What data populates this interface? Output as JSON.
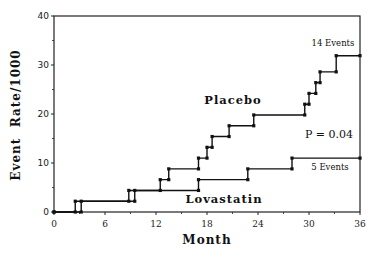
{
  "chart_data": {
    "type": "line",
    "step": true,
    "title": "",
    "xlabel": "Month",
    "ylabel": "Event  Rate/1000",
    "xlim": [
      0,
      36
    ],
    "ylim": [
      0,
      40
    ],
    "xticks": [
      0,
      6,
      12,
      18,
      24,
      30,
      36
    ],
    "yticks": [
      0,
      10,
      20,
      30,
      40
    ],
    "grid": false,
    "legend": "inline labels",
    "series": [
      {
        "name": "Placebo",
        "x": [
          0,
          2.5,
          9.5,
          12.5,
          13.5,
          17,
          18,
          18.6,
          20.6,
          23.5,
          29.5,
          30,
          30.8,
          31.3,
          33.2,
          36
        ],
        "y": [
          0,
          2.2,
          4.4,
          6.6,
          8.8,
          11.0,
          13.2,
          15.4,
          17.6,
          19.8,
          22.0,
          24.2,
          26.4,
          28.6,
          31.9,
          31.9
        ]
      },
      {
        "name": "Lovastatin",
        "x": [
          0,
          3.2,
          8.8,
          17,
          22.8,
          28,
          36
        ],
        "y": [
          0,
          2.2,
          4.4,
          6.6,
          8.8,
          11.0,
          11.0
        ]
      }
    ],
    "annotations": [
      {
        "text": "Placebo",
        "x": 21,
        "y": 22.5,
        "type": "series-label"
      },
      {
        "text": "Lovastatin",
        "x": 20,
        "y": 4.5,
        "type": "series-label"
      },
      {
        "text": "14 Events",
        "x": 33,
        "y": 34.5
      },
      {
        "text": "5 Events",
        "x": 32.5,
        "y": 8.5
      },
      {
        "text": "P = 0.04",
        "x": 32.5,
        "y": 16.5
      }
    ]
  },
  "labels": {
    "xlabel": "Month",
    "ylabel": "Event  Rate/1000",
    "placebo": "Placebo",
    "lovastatin": "Lovastatin",
    "placebo_events": "14 Events",
    "lovastatin_events": "5 Events",
    "pvalue": "P = 0.04"
  }
}
